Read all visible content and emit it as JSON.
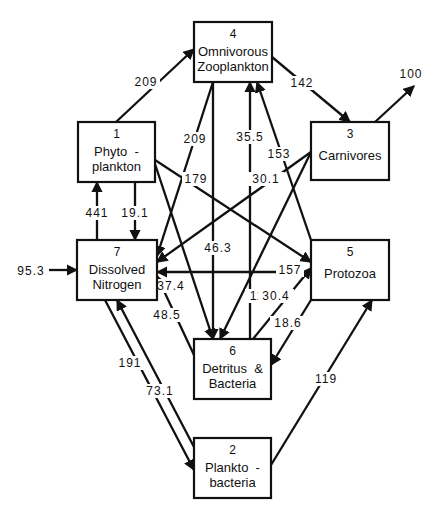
{
  "title": "",
  "nodes": [
    {
      "id": "1",
      "number": "1",
      "lines": [
        "Phyto  -",
        "plankton"
      ]
    },
    {
      "id": "2",
      "number": "2",
      "lines": [
        "Plankto  -",
        "bacteria"
      ]
    },
    {
      "id": "3",
      "number": "3",
      "lines": [
        "Carnivores"
      ]
    },
    {
      "id": "4",
      "number": "4",
      "lines": [
        "Omnivorous",
        "Zooplankton"
      ]
    },
    {
      "id": "5",
      "number": "5",
      "lines": [
        "Protozoa"
      ]
    },
    {
      "id": "6",
      "number": "6",
      "lines": [
        "Detritus  &",
        "Bacteria"
      ]
    },
    {
      "id": "7",
      "number": "7",
      "lines": [
        "Dissolved",
        "Nitrogen"
      ]
    }
  ],
  "edges": [
    {
      "from": "1",
      "to": "4",
      "value": "209"
    },
    {
      "from": "4",
      "to": "3",
      "value": "142"
    },
    {
      "from": "3",
      "to": "export",
      "value": "100"
    },
    {
      "from": "import",
      "to": "7",
      "value": "95.3"
    },
    {
      "from": "7",
      "to": "1",
      "value": "441"
    },
    {
      "from": "1",
      "to": "7",
      "value": "19.1"
    },
    {
      "from": "4",
      "to": "7",
      "value": "209"
    },
    {
      "from": "1",
      "to": "5",
      "value": "179"
    },
    {
      "from": "1",
      "to": "6",
      "value": "37.4"
    },
    {
      "from": "4",
      "to": "6",
      "value": "46.3"
    },
    {
      "from": "6",
      "to": "4",
      "value": "35.5"
    },
    {
      "from": "5",
      "to": "4",
      "value": "153"
    },
    {
      "from": "3",
      "to": "7",
      "value": "30.1"
    },
    {
      "from": "3",
      "to": "6",
      "value": "11.6"
    },
    {
      "from": "5",
      "to": "7",
      "value": "157"
    },
    {
      "from": "6",
      "to": "5",
      "value": "30.4"
    },
    {
      "from": "5",
      "to": "6",
      "value": "18.6"
    },
    {
      "from": "6",
      "to": "7",
      "value": "48.5"
    },
    {
      "from": "7",
      "to": "2",
      "value": "191"
    },
    {
      "from": "2",
      "to": "7",
      "value": "73.1"
    },
    {
      "from": "2",
      "to": "5",
      "value": "119"
    }
  ]
}
